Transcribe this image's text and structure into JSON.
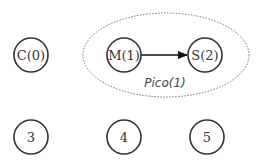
{
  "diagram": {
    "nodes": [
      {
        "id": "c0",
        "label": "C(0)"
      },
      {
        "id": "m1",
        "label": "M(1)"
      },
      {
        "id": "s2",
        "label": "S(2)"
      },
      {
        "id": "n3",
        "label": "3"
      },
      {
        "id": "n4",
        "label": "4"
      },
      {
        "id": "n5",
        "label": "5"
      }
    ],
    "edges": [
      {
        "from": "M(1)",
        "to": "S(2)",
        "directed": true
      }
    ],
    "groups": [
      {
        "label": "Pico(1)",
        "members": [
          "M(1)",
          "S(2)"
        ],
        "style": "dotted-ellipse"
      }
    ]
  }
}
